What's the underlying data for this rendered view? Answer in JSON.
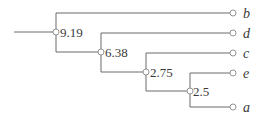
{
  "diagram": {
    "type": "dendrogram",
    "root_stub": {
      "x1": 14,
      "x2": 56,
      "y": 32
    },
    "internal_nodes": [
      {
        "id": "n1",
        "label": "9.19",
        "x": 56,
        "y": 32,
        "top": 13,
        "bottom": 52
      },
      {
        "id": "n2",
        "label": "6.38",
        "x": 101,
        "y": 52,
        "top": 33,
        "bottom": 72
      },
      {
        "id": "n3",
        "label": "2.75",
        "x": 146,
        "y": 72,
        "top": 53,
        "bottom": 91
      },
      {
        "id": "n4",
        "label": "2.5",
        "x": 190,
        "y": 91,
        "top": 73,
        "bottom": 107
      }
    ],
    "leaves": [
      {
        "label": "b",
        "y": 13
      },
      {
        "label": "d",
        "y": 33
      },
      {
        "label": "c",
        "y": 53
      },
      {
        "label": "e",
        "y": 73
      },
      {
        "label": "a",
        "y": 107
      }
    ],
    "leaf_x": 233,
    "edge_color": "#6b6b6b"
  }
}
